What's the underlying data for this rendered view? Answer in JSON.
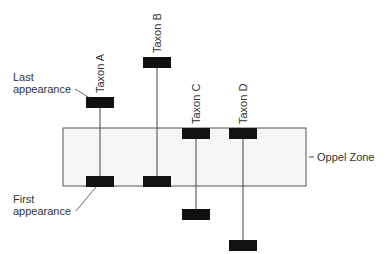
{
  "diagram": {
    "zone_label": "Oppel Zone",
    "last_appearance_label": [
      "Last",
      "appearance"
    ],
    "first_appearance_label": [
      "First",
      "appearance"
    ],
    "colors": {
      "zone_fill": "#f6f6f6",
      "zone_stroke": "#555555",
      "bar": "#111111",
      "line": "#444444",
      "text": "#333333"
    },
    "taxa": [
      {
        "name": "Taxon A",
        "x": 100,
        "top": 97,
        "bottom": 176
      },
      {
        "name": "Taxon B",
        "x": 157,
        "top": 57,
        "bottom": 176
      },
      {
        "name": "Taxon C",
        "x": 196,
        "top": 128,
        "bottom": 209
      },
      {
        "name": "Taxon D",
        "x": 243,
        "top": 128,
        "bottom": 240
      }
    ]
  }
}
